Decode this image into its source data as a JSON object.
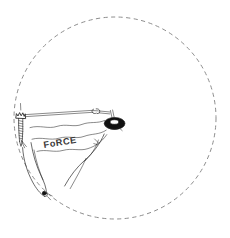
{
  "figure": {
    "background_color": "#ffffff",
    "ink_color": "#2b2b2b",
    "orbit_color": "#8d8d8d",
    "knob_color": "#111111",
    "width": 230,
    "height": 238
  },
  "annotations": {
    "force_label": "FoRCE"
  },
  "orbit": {
    "center_x": 115,
    "center_y": 118,
    "radius": 101,
    "dash_pattern": "4.2 3.4",
    "name": "dashed-trajectory-circle"
  },
  "parts": {
    "anchor_label": "bolt-anchor",
    "lever_label": "lever-bar",
    "clip_label": "small-clip",
    "knob_label": "pivot-ring-knob",
    "pointer_label": "teardrop-pointer",
    "force_lines_label": "wavy-force-lines"
  }
}
